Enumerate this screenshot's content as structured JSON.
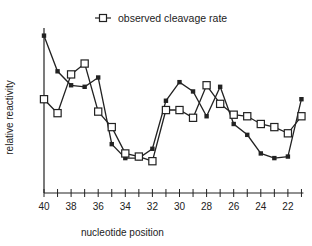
{
  "chart_data": {
    "type": "line",
    "title": "",
    "xlabel": "nucleotide position",
    "ylabel": "relative reactivity",
    "x": [
      40,
      39,
      38,
      37,
      36,
      35,
      34,
      33,
      32,
      31,
      30,
      29,
      28,
      27,
      26,
      25,
      24,
      23,
      22,
      21
    ],
    "x_tick_labels": [
      "40",
      "38",
      "36",
      "34",
      "32",
      "30",
      "28",
      "26",
      "24",
      "22"
    ],
    "x_reversed": true,
    "y_ticks_shown": false,
    "grid": false,
    "legend_position": "top-center",
    "series": [
      {
        "name": "relative reactivity (filled squares)",
        "marker": "filled-square",
        "in_legend": false,
        "values": [
          0.97,
          0.74,
          0.65,
          0.64,
          0.7,
          0.27,
          0.18,
          0.18,
          0.24,
          0.55,
          0.67,
          0.61,
          0.45,
          0.64,
          0.4,
          0.33,
          0.21,
          0.18,
          0.19,
          0.56
        ]
      },
      {
        "name": "observed cleavage rate",
        "marker": "open-square",
        "in_legend": true,
        "values": [
          0.56,
          0.47,
          0.72,
          0.79,
          0.48,
          0.38,
          0.21,
          0.19,
          0.16,
          0.49,
          0.49,
          0.44,
          0.65,
          0.53,
          0.46,
          0.45,
          0.4,
          0.38,
          0.34,
          0.45
        ]
      }
    ]
  },
  "legend": {
    "label": "observed cleavage rate"
  },
  "axes": {
    "xlabel": "nucleotide position",
    "ylabel": "relative reactivity"
  }
}
